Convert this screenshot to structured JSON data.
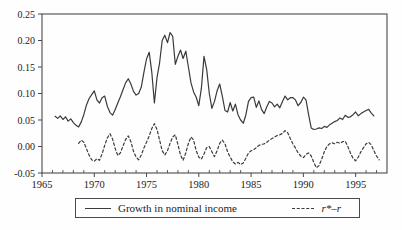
{
  "chart_data": {
    "type": "line",
    "xlim": [
      1965,
      1998
    ],
    "ylim": [
      -0.05,
      0.25
    ],
    "x_ticks": [
      1965,
      1970,
      1975,
      1980,
      1985,
      1990,
      1995
    ],
    "x_minor_tick_interval": 1,
    "y_ticks": [
      -0.05,
      0.0,
      0.05,
      0.1,
      0.15,
      0.2,
      0.25
    ],
    "grid": "off",
    "legend_position": "bottom-box",
    "colors": {
      "line": "#3a3a3a",
      "axis": "#4a4a4a",
      "text": "#222222"
    },
    "series": [
      {
        "name": "Growth in nominal income",
        "line_style": "solid",
        "x_start": 1966.25,
        "x_step": 0.25,
        "values": [
          0.057,
          0.053,
          0.058,
          0.051,
          0.056,
          0.048,
          0.052,
          0.045,
          0.04,
          0.037,
          0.046,
          0.06,
          0.078,
          0.09,
          0.098,
          0.105,
          0.088,
          0.082,
          0.092,
          0.095,
          0.076,
          0.064,
          0.059,
          0.07,
          0.082,
          0.094,
          0.107,
          0.12,
          0.128,
          0.118,
          0.104,
          0.097,
          0.1,
          0.112,
          0.14,
          0.165,
          0.178,
          0.14,
          0.082,
          0.13,
          0.158,
          0.2,
          0.21,
          0.196,
          0.215,
          0.208,
          0.155,
          0.17,
          0.182,
          0.166,
          0.18,
          0.15,
          0.12,
          0.103,
          0.093,
          0.077,
          0.11,
          0.17,
          0.145,
          0.1,
          0.072,
          0.085,
          0.105,
          0.118,
          0.095,
          0.068,
          0.065,
          0.083,
          0.067,
          0.08,
          0.06,
          0.05,
          0.044,
          0.06,
          0.085,
          0.092,
          0.093,
          0.074,
          0.086,
          0.07,
          0.062,
          0.075,
          0.085,
          0.082,
          0.075,
          0.08,
          0.073,
          0.085,
          0.095,
          0.088,
          0.092,
          0.092,
          0.088,
          0.077,
          0.083,
          0.093,
          0.088,
          0.06,
          0.035,
          0.032,
          0.033,
          0.035,
          0.034,
          0.038,
          0.036,
          0.041,
          0.044,
          0.047,
          0.049,
          0.054,
          0.051,
          0.059,
          0.055,
          0.056,
          0.06,
          0.065,
          0.058,
          0.062,
          0.065,
          0.068,
          0.07,
          0.063,
          0.058
        ]
      },
      {
        "name": "r*–r",
        "line_style": "dashed",
        "x_start": 1968.5,
        "x_step": 0.25,
        "values": [
          0.006,
          0.012,
          0.008,
          -0.004,
          -0.016,
          -0.025,
          -0.028,
          -0.023,
          -0.026,
          -0.014,
          0.002,
          0.016,
          0.024,
          0.014,
          -0.004,
          -0.017,
          -0.012,
          0.001,
          0.013,
          0.02,
          0.009,
          -0.009,
          -0.02,
          -0.025,
          -0.016,
          -0.003,
          0.008,
          0.02,
          0.034,
          0.043,
          0.032,
          0.012,
          -0.008,
          -0.016,
          -0.008,
          0.006,
          0.018,
          0.022,
          0.004,
          -0.016,
          -0.026,
          -0.012,
          0.006,
          0.018,
          0.012,
          -0.008,
          -0.02,
          -0.024,
          -0.014,
          -0.002,
          0.0,
          -0.01,
          -0.019,
          -0.008,
          0.006,
          0.012,
          0.005,
          -0.01,
          -0.02,
          -0.029,
          -0.033,
          -0.03,
          -0.034,
          -0.031,
          -0.022,
          -0.012,
          -0.008,
          -0.006,
          -0.002,
          0.002,
          0.004,
          0.005,
          0.008,
          0.012,
          0.015,
          0.018,
          0.021,
          0.022,
          0.025,
          0.03,
          0.026,
          0.015,
          0.005,
          -0.003,
          -0.012,
          -0.018,
          -0.021,
          -0.015,
          -0.012,
          -0.018,
          -0.03,
          -0.04,
          -0.036,
          -0.024,
          -0.01,
          0.0,
          0.005,
          0.007,
          0.005,
          0.008,
          0.006,
          0.009,
          0.01,
          0.0,
          -0.012,
          -0.022,
          -0.027,
          -0.02,
          -0.01,
          -0.002,
          0.005,
          0.008,
          0.003,
          -0.008,
          -0.018,
          -0.025
        ]
      }
    ]
  },
  "legend": {
    "items": [
      {
        "label": "Growth in nominal income",
        "style": "solid"
      },
      {
        "label": "r*–r",
        "style": "dashed"
      }
    ]
  }
}
